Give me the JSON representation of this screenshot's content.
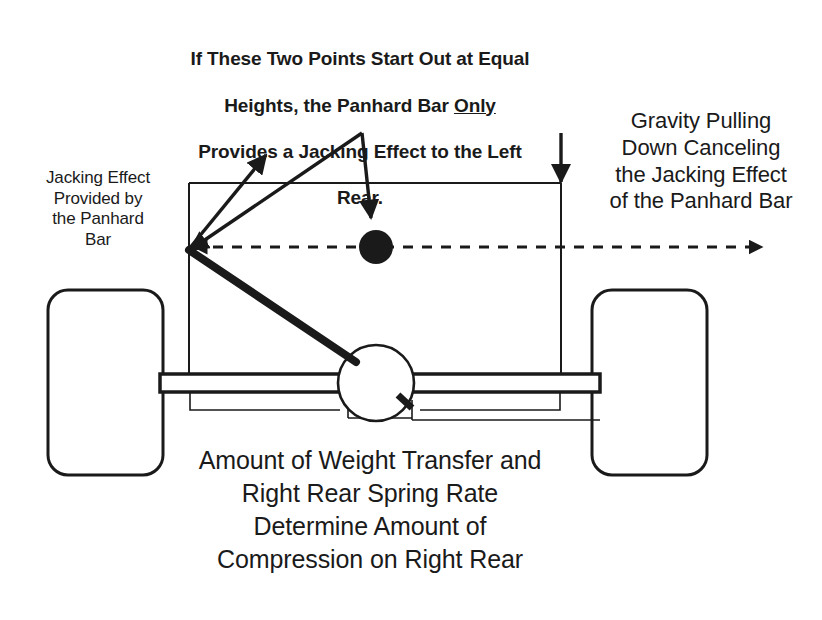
{
  "page": {
    "background_color": "#ffffff",
    "ink_color": "#1a1a1a",
    "width": 822,
    "height": 620
  },
  "annotations": {
    "top_note": {
      "line1": "If These Two Points Start Out at Equal",
      "line2_before": "Heights, the Panhard Bar ",
      "line2_emphasis": "Only",
      "line3": "Provides a Jacking Effect to the Left",
      "line4": "Rear."
    },
    "right_note": "Gravity Pulling\nDown Canceling\nthe Jacking Effect\nof the Panhard Bar",
    "left_note": "Jacking Effect\nProvided by\nthe Panhard\nBar",
    "bottom_note": "Amount of Weight Transfer and\nRight Rear Spring Rate\nDetermine Amount of\nCompression on Right Rear"
  },
  "diagram_parts": {
    "left_wheel": "left-rear-wheel",
    "right_wheel": "right-rear-wheel",
    "differential": "differential-housing",
    "axle": "rear-axle-housing",
    "panhard_bar": "panhard-bar",
    "chassis_frame": "chassis-frame-outline",
    "roll_axis": "roll-axis-dashed-line",
    "jacking_force_arrow": "jacking-force-arrow",
    "gravity_arrow": "gravity-down-arrow",
    "roll_center_marker": "roll-center-dot",
    "pivot_point": "panhard-bar-left-pivot"
  }
}
